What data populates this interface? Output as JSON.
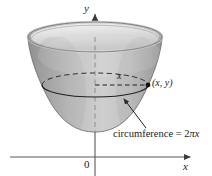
{
  "figure": {
    "axes": {
      "y_label": "y",
      "x_label": "x",
      "origin_label": "0"
    },
    "annotations": {
      "radius_label": "x",
      "point_label": "(x, y)",
      "circumference_prefix": "circumference = 2",
      "circumference_pi": "π",
      "circumference_suffix": "x"
    },
    "colors": {
      "axis": "#4d4d4d",
      "outline": "#2b2b2b",
      "surface_light": "#e9e9e9",
      "surface_mid": "#c9c9c9",
      "surface_dark": "#a2a2a2",
      "rim_inner": "#f2f2f2",
      "text": "#1a1a1a"
    },
    "geometry": {
      "rim_center_x": 95,
      "rim_center_y": 37,
      "rim_radius_x": 67,
      "rim_radius_y": 15,
      "bowl_bottom_y": 132,
      "circle_center_y": 85,
      "circle_radius_x": 53,
      "circle_radius_y": 12,
      "point_x": 148,
      "point_y": 85
    }
  }
}
